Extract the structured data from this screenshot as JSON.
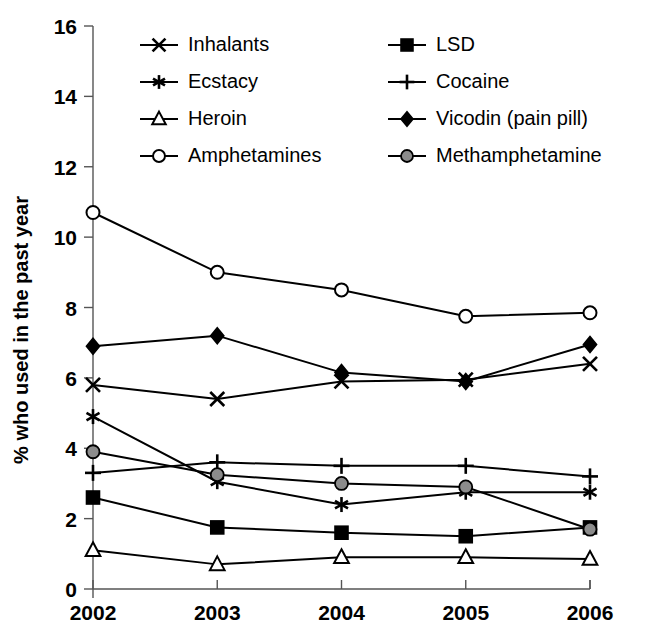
{
  "chart_data": {
    "type": "line",
    "title": "",
    "xlabel": "",
    "ylabel": "% who used in the past year",
    "x": [
      "2002",
      "2003",
      "2004",
      "2005",
      "2006"
    ],
    "categories": [
      "2002",
      "2003",
      "2004",
      "2005",
      "2006"
    ],
    "ylim": [
      0,
      16
    ],
    "yticks": [
      0,
      2,
      4,
      6,
      8,
      10,
      12,
      14,
      16
    ],
    "ytick_labels": [
      "0",
      "2",
      "4",
      "6",
      "8",
      "10",
      "12",
      "14",
      "16"
    ],
    "grid": false,
    "legend_position": "top-inside",
    "series": [
      {
        "name": "Inhalants",
        "marker": "x-cross",
        "values": [
          5.8,
          5.4,
          5.9,
          5.95,
          6.4
        ]
      },
      {
        "name": "LSD",
        "marker": "filled-square",
        "values": [
          2.6,
          1.75,
          1.6,
          1.5,
          1.75
        ]
      },
      {
        "name": "Ecstacy",
        "marker": "asterisk",
        "values": [
          4.9,
          3.05,
          2.4,
          2.75,
          2.75
        ]
      },
      {
        "name": "Cocaine",
        "marker": "plus",
        "values": [
          3.3,
          3.6,
          3.5,
          3.5,
          3.2
        ]
      },
      {
        "name": "Heroin",
        "marker": "open-triangle",
        "values": [
          1.1,
          0.7,
          0.9,
          0.9,
          0.85
        ]
      },
      {
        "name": "Vicodin (pain pill)",
        "marker": "filled-diamond",
        "values": [
          6.9,
          7.2,
          6.15,
          5.9,
          6.95
        ]
      },
      {
        "name": "Amphetamines",
        "marker": "open-circle",
        "values": [
          10.7,
          9.0,
          8.5,
          7.75,
          7.85
        ]
      },
      {
        "name": "Methamphetamine",
        "marker": "gray-circle",
        "values": [
          3.9,
          3.25,
          3.0,
          2.9,
          1.7
        ]
      }
    ]
  },
  "legend": {
    "entries": [
      {
        "label": "Inhalants",
        "marker": "x-cross",
        "column": 0,
        "row": 0
      },
      {
        "label": "Ecstacy",
        "marker": "asterisk",
        "column": 0,
        "row": 1
      },
      {
        "label": "Heroin",
        "marker": "open-triangle",
        "column": 0,
        "row": 2
      },
      {
        "label": "Amphetamines",
        "marker": "open-circle",
        "column": 0,
        "row": 3
      },
      {
        "label": "LSD",
        "marker": "filled-square",
        "column": 1,
        "row": 0
      },
      {
        "label": "Cocaine",
        "marker": "plus",
        "column": 1,
        "row": 1
      },
      {
        "label": "Vicodin (pain pill)",
        "marker": "filled-diamond",
        "column": 1,
        "row": 2
      },
      {
        "label": "Methamphetamine",
        "marker": "gray-circle",
        "column": 1,
        "row": 3
      }
    ]
  },
  "colors": {
    "line": "#000000",
    "axis": "#555555",
    "background": "#ffffff",
    "gray_marker": "#8c8c8c"
  }
}
